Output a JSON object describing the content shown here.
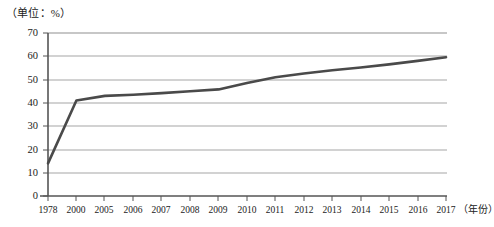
{
  "chart_data": {
    "type": "line",
    "title": "",
    "subtitle": "",
    "unit_label": "（单位：%）",
    "ylabel": "",
    "xlabel": "（年份）",
    "ylim": [
      0,
      70
    ],
    "yticks": [
      0,
      10,
      20,
      30,
      40,
      50,
      60,
      70
    ],
    "grid": true,
    "legend": "none",
    "categories": [
      "1978",
      "2000",
      "2005",
      "2006",
      "2007",
      "2008",
      "2009",
      "2010",
      "2011",
      "2012",
      "2013",
      "2014",
      "2015",
      "2016",
      "2017"
    ],
    "values": [
      14.0,
      41.0,
      43.0,
      43.5,
      44.2,
      45.0,
      45.8,
      48.5,
      51.0,
      52.6,
      54.0,
      55.2,
      56.5,
      58.0,
      59.6
    ],
    "series": [
      {
        "name": "城镇化率",
        "color": "#4a4a4a",
        "values": [
          14.0,
          41.0,
          43.0,
          43.5,
          44.2,
          45.0,
          45.8,
          48.5,
          51.0,
          52.6,
          54.0,
          55.2,
          56.5,
          58.0,
          59.6
        ]
      }
    ]
  },
  "axis": {
    "y_tick_labels": [
      "70",
      "60",
      "50",
      "40",
      "30",
      "20",
      "10",
      "0"
    ],
    "x_tick_labels": [
      "1978",
      "2000",
      "2005",
      "2006",
      "2007",
      "2008",
      "2009",
      "2010",
      "2011",
      "2012",
      "2013",
      "2014",
      "2015",
      "2016",
      "2017"
    ],
    "x_axis_title": "（年份）",
    "unit_caption": "（单位：%）"
  },
  "colors": {
    "line": "#4a4a4a",
    "grid": "#9a9a9a",
    "axis": "#555555",
    "text": "#1a1a1a",
    "background": "#ffffff"
  }
}
